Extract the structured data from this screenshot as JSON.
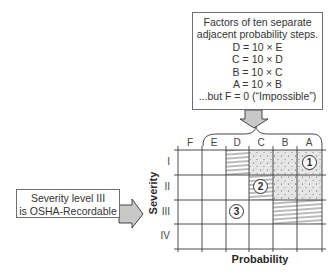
{
  "factors_box": {
    "lines": [
      "Factors of ten separate",
      "adjacent probability steps.",
      "D = 10 × E",
      "C = 10 × D",
      "B = 10 × C",
      "A = 10 × B",
      "...but F = 0 (“Impossible”)"
    ]
  },
  "severity_box": {
    "lines": [
      "Severity level III",
      "is OSHA-Recordable"
    ]
  },
  "matrix": {
    "x_axis_label": "Probability",
    "y_axis_label": "Severity",
    "columns": [
      "F",
      "E",
      "D",
      "C",
      "B",
      "A"
    ],
    "rows": [
      "I",
      "II",
      "III",
      "IV"
    ],
    "cells": [
      [
        "blank",
        "blank",
        "hatched",
        "dotted",
        "dotted",
        "dotted"
      ],
      [
        "blank",
        "blank",
        "blank",
        "hatched",
        "dotted",
        "dotted"
      ],
      [
        "blank",
        "blank",
        "blank",
        "blank",
        "hatched",
        "hatched"
      ],
      [
        "blank",
        "blank",
        "blank",
        "blank",
        "blank",
        "blank"
      ]
    ],
    "markers": [
      {
        "label": "1",
        "row": "I",
        "column": "A"
      },
      {
        "label": "2",
        "row": "II",
        "column": "C"
      },
      {
        "label": "3",
        "row": "III",
        "column": "D"
      }
    ]
  },
  "colors": {
    "arrow_fill": "#c8c8c8",
    "grid_line": "#3a3a3a",
    "dotted_fill": "#e4e4e4"
  }
}
